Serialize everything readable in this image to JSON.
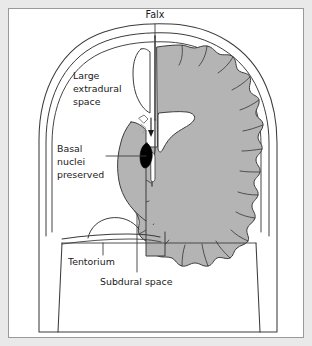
{
  "figure": {
    "type": "anatomical-diagram",
    "background_color": "#e9e9e9",
    "panel_color": "#ffffff",
    "brain_fill_color": "#b4b4b4",
    "line_color": "#3c3c3c",
    "marker_color": "#000000",
    "text_color": "#1a1a1a"
  },
  "labels": {
    "falx": "Falx",
    "extradural_line1": "Large",
    "extradural_line2": "extradural",
    "extradural_line3": "space",
    "basal_line1": "Basal",
    "basal_line2": "nuclei",
    "basal_line3": "preserved",
    "tentorium": "Tentorium",
    "subdural": "Subdural space"
  }
}
